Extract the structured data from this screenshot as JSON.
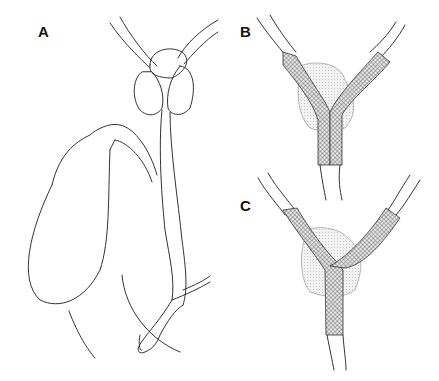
{
  "figure": {
    "panels": [
      {
        "id": "A",
        "label": "A",
        "description": "Native biliary anatomy: gallbladder, cystic duct, common bile duct, hilar ducts with mass at bifurcation, duodenal papilla"
      },
      {
        "id": "B",
        "label": "B",
        "description": "Side-by-side bilateral mesh stents across hilar mass"
      },
      {
        "id": "C",
        "label": "C",
        "description": "Stent-in-stent (Y-configuration) bilateral mesh stents across hilar mass"
      }
    ],
    "colors": {
      "line": "#333333",
      "mesh": "#555555",
      "mass": "#d9d9d9",
      "background": "#ffffff"
    }
  }
}
